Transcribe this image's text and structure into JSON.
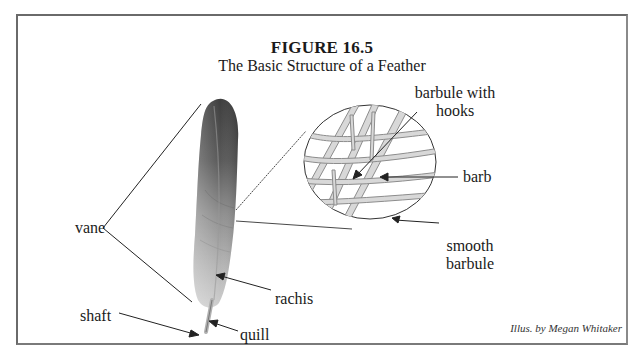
{
  "figure": {
    "number": "FIGURE 16.5",
    "title": "The Basic Structure of a Feather",
    "credit": "Illus. by Megan Whitaker"
  },
  "labels": {
    "vane": "vane",
    "shaft": "shaft",
    "rachis": "rachis",
    "quill": "quill",
    "barbule_hooks_line1": "barbule with",
    "barbule_hooks_line2": "hooks",
    "barb": "barb",
    "smooth_barbule_line1": "smooth",
    "smooth_barbule_line2": "barbule"
  },
  "colors": {
    "frame": "#6a6a6a",
    "feather_dark": "#4a4a4a",
    "feather_mid": "#8a8a8a",
    "feather_light": "#c4c4c4",
    "line": "#222222",
    "barb_fill": "#d8d8d8",
    "barb_stroke": "#8c8c8c"
  }
}
